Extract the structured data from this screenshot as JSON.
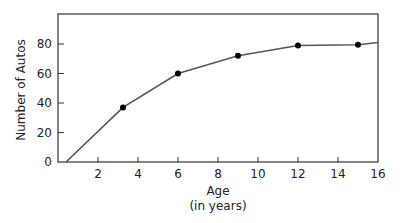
{
  "chart_data": {
    "type": "line",
    "title": "",
    "xlabel": "Age",
    "xlabel_sub": "(in years)",
    "ylabel": "Number of Autos",
    "xlim": [
      0,
      16
    ],
    "ylim": [
      0,
      100
    ],
    "x_ticks": [
      2,
      4,
      6,
      8,
      10,
      12,
      14,
      16
    ],
    "y_ticks": [
      0,
      20,
      40,
      60,
      80
    ],
    "grid": false,
    "legend": null,
    "series": [
      {
        "name": "Number of Autos",
        "curve": [
          [
            0.4,
            0
          ],
          [
            3.25,
            37
          ],
          [
            6,
            60
          ],
          [
            9,
            72
          ],
          [
            12,
            79
          ],
          [
            15,
            79.5
          ],
          [
            16,
            81
          ]
        ],
        "markers": [
          [
            3.25,
            37
          ],
          [
            6,
            60
          ],
          [
            9,
            72
          ],
          [
            12,
            79
          ],
          [
            15,
            79.5
          ]
        ]
      }
    ]
  },
  "colors": {
    "axis": "#333333",
    "line": "#555555",
    "marker": "#000000"
  }
}
